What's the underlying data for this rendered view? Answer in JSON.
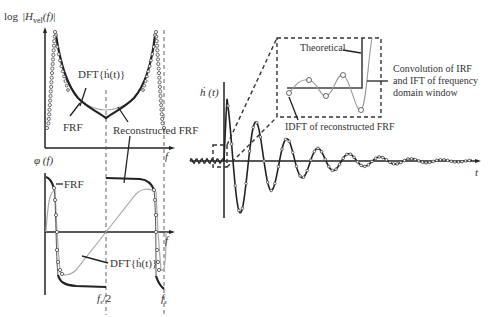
{
  "figure": {
    "top_left_panel": {
      "ylabel": "log|H_vel(f)|",
      "ylabel_parts": {
        "prefix": "log",
        "H": "H",
        "sub": "vel",
        "arg": "(f)"
      },
      "xlabel": "f",
      "annotations": {
        "dft": "DFT{ḣ(t)}",
        "frf": "FRF",
        "reconstructed": "Reconstructed FRF"
      }
    },
    "bottom_left_panel": {
      "ylabel": "φ (f)",
      "xlabel": "f",
      "annotations": {
        "frf": "FRF",
        "dft": "DFT{ḣ(t)}"
      },
      "ticks": {
        "half": "fs/2",
        "half_main": "f",
        "half_sub": "s",
        "half_tail": "/2",
        "full_main": "f",
        "full_sub": "s"
      }
    },
    "right_panel": {
      "ylabel": "ḣ (t)",
      "xlabel": "t",
      "inset": {
        "theoretical": "Theoretical",
        "convolution": [
          "Convolution of IRF",
          "and IFT of frequency",
          "domain window"
        ],
        "idft": "IDFT of reconstructed FRF"
      }
    }
  }
}
